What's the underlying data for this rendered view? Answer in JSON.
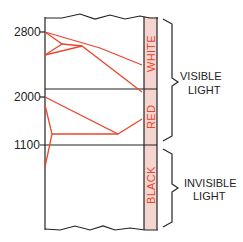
{
  "diagram": {
    "y_axis_ticks": [
      {
        "label": "2800",
        "y": 32
      },
      {
        "label": "2000",
        "y": 97
      },
      {
        "label": "1100",
        "y": 145
      }
    ],
    "color_strip": {
      "fill": "#f5d5d0",
      "text_color": "#e8472c",
      "bands": [
        {
          "label": "WHITE"
        },
        {
          "label": "RED"
        },
        {
          "label": "BLACK"
        }
      ]
    },
    "brackets": [
      {
        "line1": "VISIBLE",
        "line2": "LIGHT"
      },
      {
        "line1": "INVISIBLE",
        "line2": "LIGHT"
      }
    ],
    "line_color": "#e8472c",
    "frame_color": "#222222"
  }
}
